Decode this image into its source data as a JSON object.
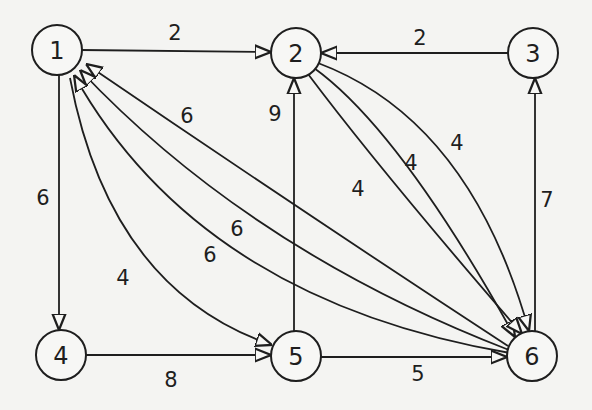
{
  "diagram": {
    "type": "directed-weighted-graph",
    "colors": {
      "ink": "#1e1e1e",
      "paper": "#f4f4f2"
    },
    "nodes": [
      {
        "id": "1",
        "label": "1",
        "x": 57,
        "y": 50
      },
      {
        "id": "2",
        "label": "2",
        "x": 296,
        "y": 53
      },
      {
        "id": "3",
        "label": "3",
        "x": 533,
        "y": 53
      },
      {
        "id": "4",
        "label": "4",
        "x": 61,
        "y": 355
      },
      {
        "id": "5",
        "label": "5",
        "x": 296,
        "y": 356
      },
      {
        "id": "6",
        "label": "6",
        "x": 532,
        "y": 356
      }
    ],
    "edges": [
      {
        "from": "1",
        "to": "2",
        "weight": "2"
      },
      {
        "from": "3",
        "to": "2",
        "weight": "2"
      },
      {
        "from": "1",
        "to": "4",
        "weight": "6"
      },
      {
        "from": "4",
        "to": "5",
        "weight": "8"
      },
      {
        "from": "5",
        "to": "6",
        "weight": "5"
      },
      {
        "from": "5",
        "to": "2",
        "weight": "9"
      },
      {
        "from": "6",
        "to": "3",
        "weight": "7"
      },
      {
        "from": "2",
        "to": "6",
        "weight": "4"
      },
      {
        "from": "2",
        "to": "6",
        "weight": "4"
      },
      {
        "from": "2",
        "to": "6",
        "weight": "4"
      },
      {
        "from": "6",
        "to": "1",
        "weight": "6"
      },
      {
        "from": "6",
        "to": "1",
        "weight": "6"
      },
      {
        "from": "6",
        "to": "1",
        "weight": "6"
      },
      {
        "from": "1",
        "to": "5",
        "weight": "4"
      }
    ]
  }
}
